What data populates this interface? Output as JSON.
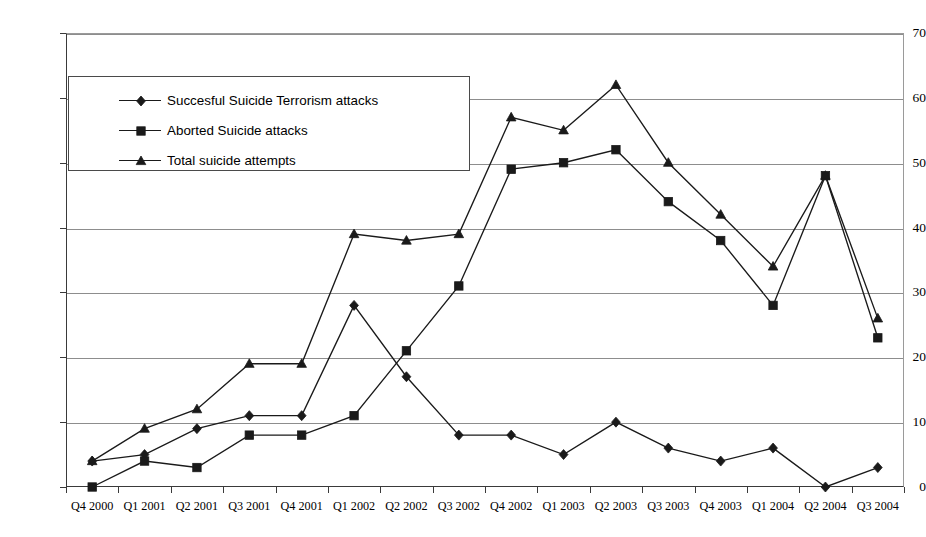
{
  "chart_data": {
    "type": "line",
    "title": "",
    "xlabel": "",
    "ylabel": "",
    "ylim": [
      0,
      70
    ],
    "ytick_step": 10,
    "yticks": [
      0,
      10,
      20,
      30,
      40,
      50,
      60,
      70
    ],
    "grid": "horizontal",
    "legend_position": "upper-left-inside",
    "categories": [
      "Q4 2000",
      "Q1 2001",
      "Q2 2001",
      "Q3 2001",
      "Q4 2001",
      "Q1 2002",
      "Q2 2002",
      "Q3 2002",
      "Q4 2002",
      "Q1 2003",
      "Q2 2003",
      "Q3 2003",
      "Q4 2003",
      "Q1 2004",
      "Q2 2004",
      "Q3 2004"
    ],
    "series": [
      {
        "name": "Succesful Suicide Terrorism attacks",
        "marker": "diamond",
        "color": "#1a1a1a",
        "values": [
          4,
          5,
          9,
          11,
          11,
          28,
          17,
          8,
          8,
          5,
          10,
          6,
          4,
          6,
          0,
          3
        ]
      },
      {
        "name": "Aborted Suicide  attacks",
        "marker": "square",
        "color": "#1a1a1a",
        "values": [
          0,
          4,
          3,
          8,
          8,
          11,
          21,
          31,
          49,
          50,
          52,
          44,
          38,
          28,
          48,
          23
        ]
      },
      {
        "name": "Total suicide  attempts",
        "marker": "triangle",
        "color": "#1a1a1a",
        "values": [
          4,
          9,
          12,
          19,
          19,
          39,
          38,
          39,
          57,
          55,
          62,
          50,
          42,
          34,
          48,
          26
        ]
      }
    ]
  },
  "axis": {
    "y_tick_labels": [
      "0",
      "10",
      "20",
      "30",
      "40",
      "50",
      "60",
      "70"
    ]
  },
  "legend": {
    "entries": [
      {
        "label": "Succesful Suicide Terrorism attacks",
        "marker": "diamond"
      },
      {
        "label": "Aborted Suicide  attacks",
        "marker": "square"
      },
      {
        "label": "Total suicide  attempts",
        "marker": "triangle"
      }
    ]
  }
}
